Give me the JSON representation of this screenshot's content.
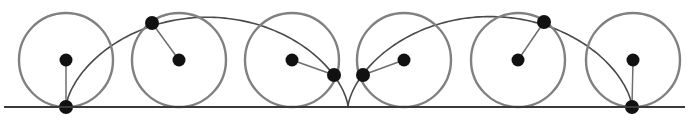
{
  "figure": {
    "width": 689,
    "height": 127,
    "background_color": "#ffffff"
  },
  "colors": {
    "baseline": "#3a3a3a",
    "circle_stroke": "#808080",
    "curve_stroke": "#4a4a4a",
    "radius_line": "#6e6e6e",
    "dot_fill": "#111111"
  },
  "strokes": {
    "baseline_width": 1.8,
    "circle_width": 2.4,
    "curve_width": 1.6,
    "radius_width": 1.5
  },
  "chart_data": {
    "type": "scatter",
    "xlabel": "",
    "ylabel": "",
    "xlim": [
      0,
      689
    ],
    "ylim": [
      0,
      127
    ],
    "grid": false,
    "legend": "none",
    "baseline": {
      "label": "rolling line",
      "x1": 4,
      "y1": 107,
      "x2": 685,
      "y2": 107
    },
    "circle_radius": 47,
    "circles": [
      {
        "index": 1,
        "center_x": 66,
        "center_y": 60,
        "radius": 47,
        "point_x": 66,
        "point_y": 107,
        "point_angle_deg": 0
      },
      {
        "index": 2,
        "center_x": 179,
        "center_y": 60,
        "radius": 47,
        "point_x": 152,
        "point_y": 23,
        "point_angle_deg": 234
      },
      {
        "index": 3,
        "center_x": 292,
        "center_y": 60,
        "radius": 47,
        "point_x": 334,
        "point_y": 75,
        "point_angle_deg": 108
      },
      {
        "index": 4,
        "center_x": 404,
        "center_y": 60,
        "radius": 47,
        "point_x": 363,
        "point_y": 75,
        "point_angle_deg": 251
      },
      {
        "index": 5,
        "center_x": 518,
        "center_y": 60,
        "radius": 47,
        "point_x": 544,
        "point_y": 22,
        "point_angle_deg": 125
      },
      {
        "index": 6,
        "center_x": 633,
        "center_y": 60,
        "radius": 47,
        "point_x": 632,
        "point_y": 107,
        "point_angle_deg": 0
      }
    ],
    "cusps": [
      {
        "x": 66,
        "y": 107
      },
      {
        "x": 348,
        "y": 107
      },
      {
        "x": 632,
        "y": 107
      }
    ],
    "arches": [
      {
        "index": 1,
        "start_x": 66,
        "end_x": 348,
        "peak_x": 207,
        "peak_y": 13
      },
      {
        "index": 2,
        "start_x": 348,
        "end_x": 632,
        "peak_x": 490,
        "peak_y": 13
      }
    ],
    "arch_width": 282,
    "arch_height": 94,
    "center_dot_radius": 6.5,
    "tracing_dot_radius": 7.0
  },
  "elements": {
    "baseline_name": "rolling-baseline",
    "circle_name": "rolling-circle",
    "center_dot_name": "circle-center-dot",
    "tracing_dot_name": "tracing-point-dot",
    "radius_line_name": "radius-segment",
    "curve_name": "cycloid-arch"
  }
}
